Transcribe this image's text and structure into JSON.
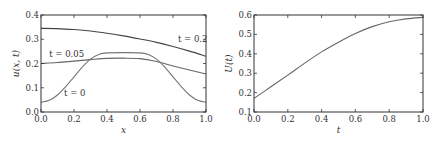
{
  "chart_data": [
    {
      "type": "line",
      "title": "",
      "xlabel": "x",
      "ylabel": "u(x, t)",
      "xlim": [
        0.0,
        1.0
      ],
      "ylim": [
        0.0,
        0.4
      ],
      "xticks": [
        "0.0",
        "0.2",
        "0.4",
        "0.6",
        "0.8",
        "1.0"
      ],
      "yticks": [
        "0.0",
        "0.1",
        "0.2",
        "0.3",
        "0.4"
      ],
      "grid": false,
      "series": [
        {
          "name": "t=0.2",
          "color": "#444444",
          "x": [
            0.0,
            0.1,
            0.2,
            0.3,
            0.4,
            0.5,
            0.6,
            0.7,
            0.8,
            0.9,
            1.0
          ],
          "y": [
            0.345,
            0.344,
            0.34,
            0.334,
            0.325,
            0.314,
            0.301,
            0.287,
            0.27,
            0.251,
            0.23
          ]
        },
        {
          "name": "t=0.05",
          "color": "#666666",
          "x": [
            0.0,
            0.1,
            0.2,
            0.3,
            0.4,
            0.5,
            0.6,
            0.7,
            0.8,
            0.9,
            1.0
          ],
          "y": [
            0.2,
            0.204,
            0.21,
            0.216,
            0.221,
            0.222,
            0.22,
            0.208,
            0.19,
            0.173,
            0.157
          ]
        },
        {
          "name": "t=0",
          "color": "#777777",
          "x": [
            0.0,
            0.05,
            0.1,
            0.15,
            0.2,
            0.25,
            0.3,
            0.35,
            0.4,
            0.5,
            0.6,
            0.65,
            0.7,
            0.75,
            0.8,
            0.85,
            0.9,
            0.95,
            1.0
          ],
          "y": [
            0.04,
            0.048,
            0.07,
            0.105,
            0.145,
            0.185,
            0.218,
            0.237,
            0.244,
            0.245,
            0.244,
            0.237,
            0.218,
            0.185,
            0.145,
            0.105,
            0.07,
            0.048,
            0.04
          ]
        }
      ],
      "annotations": [
        {
          "text": "t = 0.2",
          "x": 0.83,
          "y": 0.29
        },
        {
          "text": "t = 0.05",
          "x": 0.05,
          "y": 0.225
        },
        {
          "text": "t = 0",
          "x": 0.14,
          "y": 0.065
        }
      ]
    },
    {
      "type": "line",
      "title": "",
      "xlabel": "t",
      "ylabel": "U(t)",
      "xlim": [
        0.0,
        1.0
      ],
      "ylim": [
        0.1,
        0.6
      ],
      "xticks": [
        "0.0",
        "0.2",
        "0.4",
        "0.6",
        "0.8",
        "1.0"
      ],
      "yticks": [
        "0.1",
        "0.2",
        "0.3",
        "0.4",
        "0.5",
        "0.6"
      ],
      "grid": false,
      "series": [
        {
          "name": "U(t)",
          "color": "#666666",
          "x": [
            0.0,
            0.1,
            0.2,
            0.3,
            0.4,
            0.5,
            0.6,
            0.7,
            0.8,
            0.9,
            1.0
          ],
          "y": [
            0.17,
            0.23,
            0.29,
            0.352,
            0.41,
            0.46,
            0.505,
            0.54,
            0.565,
            0.58,
            0.588
          ]
        }
      ],
      "annotations": []
    }
  ]
}
